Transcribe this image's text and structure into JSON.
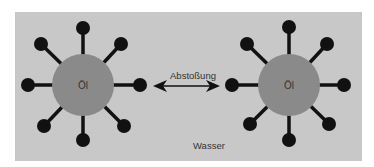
{
  "diagram": {
    "background": "#c8c8c8",
    "molecule_color": "#8a8a8a",
    "ball_color": "#111111",
    "left_molecule": {
      "label": "Öl"
    },
    "right_molecule": {
      "label": "Öl"
    },
    "arrow_label": "Abstoßung",
    "medium_label": "Wasser"
  }
}
